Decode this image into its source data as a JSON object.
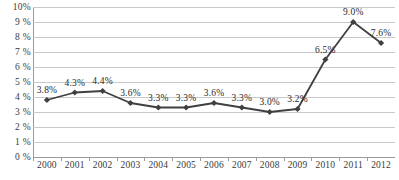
{
  "chart_data": {
    "type": "line",
    "title": "",
    "xlabel": "",
    "ylabel": "",
    "categories": [
      "2000",
      "2001",
      "2002",
      "2003",
      "2004",
      "2005",
      "2006",
      "2007",
      "2008",
      "2009",
      "2010",
      "2011",
      "2012"
    ],
    "values": [
      3.8,
      4.3,
      4.4,
      3.6,
      3.3,
      3.3,
      3.6,
      3.3,
      3.0,
      3.2,
      6.5,
      9.0,
      7.6
    ],
    "point_labels": [
      "3.8%",
      "4.3%",
      "4.4%",
      "3.6%",
      "3.3%",
      "3.3%",
      "3.6%",
      "3.3%",
      "3.0%",
      "3.2%",
      "6.5%",
      "9.0%",
      "7.6%"
    ],
    "ylim": [
      0,
      10
    ],
    "ytick_values": [
      0,
      1,
      2,
      3,
      4,
      5,
      6,
      7,
      8,
      9,
      10
    ],
    "ytick_labels": [
      "0 %",
      "1 %",
      "2 %",
      "3 %",
      "4 %",
      "5 %",
      "6 %",
      "7 %",
      "8 %",
      "9 %",
      "10%"
    ],
    "grid": true,
    "legend": "none",
    "series_color": "#404040",
    "grid_color": "#c9c9c9",
    "axis_color": "#9a9a9a",
    "marker": "diamond",
    "series": [
      {
        "name": "",
        "values": [
          3.8,
          4.3,
          4.4,
          3.6,
          3.3,
          3.3,
          3.6,
          3.3,
          3.0,
          3.2,
          6.5,
          9.0,
          7.6
        ]
      }
    ]
  }
}
